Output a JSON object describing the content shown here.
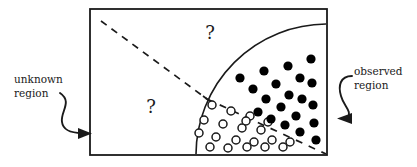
{
  "figure": {
    "background_color": "#ffffff",
    "stroke_color": "#1a1a1a",
    "box": {
      "x": 90,
      "y": 9,
      "width": 237,
      "height": 146,
      "stroke_width": 1.8
    },
    "arc": {
      "description": "quarter-circle boundary separating observed region",
      "center_x": 327,
      "center_y": 155,
      "radius": 131,
      "stroke_width": 1.6
    },
    "dashed_line_upper": {
      "x1": 101,
      "y1": 21,
      "x2": 207,
      "y2": 99,
      "dash": "7 6"
    },
    "dashed_line_lower": {
      "x1": 207,
      "y1": 99,
      "x2": 326,
      "y2": 154,
      "dash": "7 7"
    },
    "tick_mark": {
      "x": 207,
      "y": 99
    }
  },
  "labels": {
    "unknown_region": {
      "line1": "unknown",
      "line2": "region",
      "x": 14,
      "y_line1": 83,
      "y_line2": 97
    },
    "observed_region": {
      "line1": "observed",
      "line2": "region",
      "x": 354,
      "y_line1": 75,
      "y_line2": 89
    },
    "question_mark_upper": {
      "text": "?",
      "x": 210,
      "y": 39
    },
    "question_mark_lower": {
      "text": "?",
      "x": 151,
      "y": 113
    }
  },
  "arrows": {
    "left_arrow": {
      "name": "unknown-region-arrow",
      "path": "M 60 93 C 73 102 60 112 62 122 C 63 130 72 133 82 133",
      "head": "M 78 128 L 92 133.5 L 78 139 Z",
      "direction": "right"
    },
    "right_arrow": {
      "name": "observed-region-arrow",
      "path": "M 352 76 C 340 76 338 86 341 96 C 344 107 352 110 348 119",
      "head": "M 352 113 L 337 118.5 L 352 124 Z",
      "direction": "left"
    }
  },
  "markers": {
    "filled_label": "observed data point (filled)",
    "open_label": "observed data point (open)",
    "filled_radius": 4.6,
    "open_radius": 4.0,
    "filled_color": "#000000",
    "open_fill": "#ffffff",
    "filled_points": [
      [
        311,
        59
      ],
      [
        288,
        66
      ],
      [
        264,
        71
      ],
      [
        240,
        78
      ],
      [
        300,
        78
      ],
      [
        276,
        84
      ],
      [
        253,
        89
      ],
      [
        312,
        83
      ],
      [
        289,
        95
      ],
      [
        266,
        99
      ],
      [
        302,
        99
      ],
      [
        281,
        107
      ],
      [
        258,
        112
      ],
      [
        313,
        105
      ],
      [
        296,
        116
      ],
      [
        314,
        123
      ],
      [
        300,
        132
      ],
      [
        316,
        140
      ],
      [
        285,
        125
      ],
      [
        271,
        119
      ]
    ],
    "open_points": [
      [
        212,
        105
      ],
      [
        231,
        111
      ],
      [
        250,
        116
      ],
      [
        204,
        120
      ],
      [
        223,
        124
      ],
      [
        242,
        128
      ],
      [
        261,
        130
      ],
      [
        199,
        133
      ],
      [
        216,
        137
      ],
      [
        236,
        140
      ],
      [
        254,
        142
      ],
      [
        272,
        140
      ],
      [
        290,
        142
      ],
      [
        210,
        147
      ],
      [
        228,
        148
      ],
      [
        247,
        147
      ],
      [
        265,
        147
      ],
      [
        283,
        147
      ],
      [
        246,
        121
      ],
      [
        268,
        122
      ]
    ]
  }
}
